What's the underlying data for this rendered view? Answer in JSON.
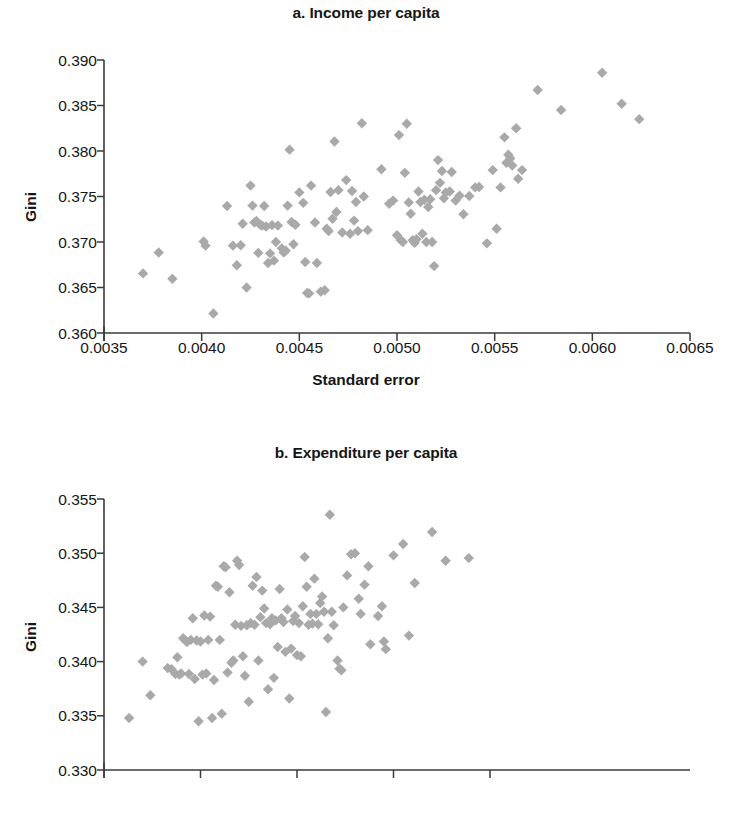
{
  "figure": {
    "marker_color": "#a9a9a9",
    "axis_color": "#3a3a3a",
    "text_color": "#161616",
    "background": "#ffffff"
  },
  "panel_a": {
    "title": "a. Income per capita",
    "ylabel": "Gini",
    "xlabel": "Standard error"
  },
  "panel_b": {
    "title": "b. Expenditure per capita",
    "ylabel": "Gini",
    "xlabel": "Standard error"
  },
  "chart_data": [
    {
      "type": "scatter",
      "id": "a",
      "title": "a. Income per capita",
      "xlabel": "Standard error",
      "ylabel": "Gini",
      "xlim": [
        0.0035,
        0.0065
      ],
      "ylim": [
        0.36,
        0.39
      ],
      "xticks": [
        0.0035,
        0.004,
        0.0045,
        0.005,
        0.0055,
        0.006,
        0.0065
      ],
      "xtick_labels": [
        "0.0035",
        "0.0040",
        "0.0045",
        "0.0050",
        "0.0055",
        "0.0060",
        "0.0065"
      ],
      "yticks": [
        0.36,
        0.365,
        0.37,
        0.375,
        0.38,
        0.385,
        0.39
      ],
      "ytick_labels": [
        "0.360",
        "0.365",
        "0.370",
        "0.375",
        "0.380",
        "0.385",
        "0.390"
      ],
      "grid": false,
      "legend": null,
      "marker": "diamond",
      "marker_color": "#a9a9a9",
      "points": [
        [
          0.0037,
          0.36655
        ],
        [
          0.00378,
          0.36885
        ],
        [
          0.00385,
          0.36595
        ],
        [
          0.00401,
          0.37005
        ],
        [
          0.00402,
          0.3696
        ],
        [
          0.00406,
          0.36215
        ],
        [
          0.00413,
          0.37395
        ],
        [
          0.00416,
          0.3696
        ],
        [
          0.00418,
          0.36745
        ],
        [
          0.0042,
          0.36965
        ],
        [
          0.00421,
          0.372
        ],
        [
          0.00423,
          0.365
        ],
        [
          0.00425,
          0.3762
        ],
        [
          0.00426,
          0.374
        ],
        [
          0.00427,
          0.37215
        ],
        [
          0.00428,
          0.3723
        ],
        [
          0.00429,
          0.3688
        ],
        [
          0.0043,
          0.3719
        ],
        [
          0.00431,
          0.3718
        ],
        [
          0.00432,
          0.37395
        ],
        [
          0.00433,
          0.3717
        ],
        [
          0.00434,
          0.3677
        ],
        [
          0.00435,
          0.36875
        ],
        [
          0.00436,
          0.37185
        ],
        [
          0.00437,
          0.36795
        ],
        [
          0.00438,
          0.37
        ],
        [
          0.00439,
          0.3718
        ],
        [
          0.00441,
          0.3693
        ],
        [
          0.00442,
          0.36885
        ],
        [
          0.00443,
          0.36905
        ],
        [
          0.00444,
          0.374
        ],
        [
          0.00445,
          0.38015
        ],
        [
          0.00446,
          0.3722
        ],
        [
          0.00447,
          0.36975
        ],
        [
          0.00448,
          0.3719
        ],
        [
          0.0045,
          0.37545
        ],
        [
          0.00452,
          0.3743
        ],
        [
          0.00453,
          0.3678
        ],
        [
          0.00454,
          0.3644
        ],
        [
          0.00455,
          0.36435
        ],
        [
          0.00456,
          0.3762
        ],
        [
          0.00458,
          0.37215
        ],
        [
          0.00459,
          0.3677
        ],
        [
          0.00461,
          0.36455
        ],
        [
          0.00463,
          0.3647
        ],
        [
          0.00464,
          0.37145
        ],
        [
          0.00465,
          0.3712
        ],
        [
          0.00466,
          0.3755
        ],
        [
          0.00467,
          0.37255
        ],
        [
          0.00468,
          0.38105
        ],
        [
          0.00469,
          0.3733
        ],
        [
          0.0047,
          0.3757
        ],
        [
          0.00472,
          0.37105
        ],
        [
          0.00474,
          0.3768
        ],
        [
          0.00476,
          0.3709
        ],
        [
          0.00477,
          0.3756
        ],
        [
          0.00478,
          0.37235
        ],
        [
          0.00479,
          0.3744
        ],
        [
          0.0048,
          0.3712
        ],
        [
          0.00482,
          0.38305
        ],
        [
          0.00483,
          0.375
        ],
        [
          0.00485,
          0.3713
        ],
        [
          0.00492,
          0.378
        ],
        [
          0.00496,
          0.3742
        ],
        [
          0.00498,
          0.37455
        ],
        [
          0.005,
          0.37075
        ],
        [
          0.00501,
          0.38175
        ],
        [
          0.00502,
          0.3702
        ],
        [
          0.00503,
          0.37
        ],
        [
          0.00504,
          0.3776
        ],
        [
          0.00505,
          0.383
        ],
        [
          0.00506,
          0.37435
        ],
        [
          0.00507,
          0.3731
        ],
        [
          0.00508,
          0.3702
        ],
        [
          0.00509,
          0.3699
        ],
        [
          0.0051,
          0.3703
        ],
        [
          0.00511,
          0.37555
        ],
        [
          0.00512,
          0.3744
        ],
        [
          0.00513,
          0.3709
        ],
        [
          0.00514,
          0.37465
        ],
        [
          0.00515,
          0.37
        ],
        [
          0.00516,
          0.37385
        ],
        [
          0.00517,
          0.3747
        ],
        [
          0.00518,
          0.37
        ],
        [
          0.00519,
          0.36735
        ],
        [
          0.0052,
          0.3757
        ],
        [
          0.00521,
          0.379
        ],
        [
          0.00522,
          0.3765
        ],
        [
          0.00523,
          0.3778
        ],
        [
          0.00524,
          0.3748
        ],
        [
          0.00525,
          0.37545
        ],
        [
          0.00527,
          0.37555
        ],
        [
          0.00528,
          0.3777
        ],
        [
          0.0053,
          0.37455
        ],
        [
          0.00532,
          0.3751
        ],
        [
          0.00534,
          0.37305
        ],
        [
          0.00537,
          0.37505
        ],
        [
          0.0054,
          0.376
        ],
        [
          0.00542,
          0.37605
        ],
        [
          0.00546,
          0.36985
        ],
        [
          0.00549,
          0.3779
        ],
        [
          0.00551,
          0.37145
        ],
        [
          0.00553,
          0.376
        ],
        [
          0.00555,
          0.3815
        ],
        [
          0.00556,
          0.3787
        ],
        [
          0.00557,
          0.3796
        ],
        [
          0.00558,
          0.3792
        ],
        [
          0.00559,
          0.3784
        ],
        [
          0.00561,
          0.3825
        ],
        [
          0.00562,
          0.37695
        ],
        [
          0.00564,
          0.3779
        ],
        [
          0.00572,
          0.3867
        ],
        [
          0.00584,
          0.3845
        ],
        [
          0.00605,
          0.3886
        ],
        [
          0.00615,
          0.3852
        ],
        [
          0.00624,
          0.3835
        ]
      ]
    },
    {
      "type": "scatter",
      "id": "b",
      "title": "b. Expenditure per capita",
      "xlabel": "Standard error",
      "ylabel": "Gini",
      "xlim": [
        0.0032,
        0.00546
      ],
      "ylim": [
        0.33,
        0.355
      ],
      "xticks": [
        0.0032,
        0.0037,
        0.0042,
        0.0047,
        0.0052
      ],
      "xtick_labels": [
        "0.0032",
        "0.0037",
        "0.0042",
        "0.0047",
        "0.0052"
      ],
      "yticks": [
        0.33,
        0.335,
        0.34,
        0.345,
        0.35,
        0.355
      ],
      "ytick_labels": [
        "0.330",
        "0.335",
        "0.340",
        "0.345",
        "0.350",
        "0.355"
      ],
      "grid": false,
      "legend": null,
      "marker": "diamond",
      "marker_color": "#a9a9a9",
      "points": [
        [
          0.00333,
          0.3348
        ],
        [
          0.0034,
          0.34
        ],
        [
          0.00344,
          0.3369
        ],
        [
          0.00353,
          0.3394
        ],
        [
          0.00355,
          0.3393
        ],
        [
          0.00357,
          0.33885
        ],
        [
          0.00358,
          0.3404
        ],
        [
          0.00359,
          0.3388
        ],
        [
          0.0036,
          0.3389
        ],
        [
          0.00361,
          0.34215
        ],
        [
          0.00362,
          0.342
        ],
        [
          0.00363,
          0.3418
        ],
        [
          0.00364,
          0.33885
        ],
        [
          0.00365,
          0.342
        ],
        [
          0.00366,
          0.344
        ],
        [
          0.00367,
          0.3384
        ],
        [
          0.00368,
          0.34195
        ],
        [
          0.00369,
          0.3345
        ],
        [
          0.0037,
          0.34185
        ],
        [
          0.00371,
          0.3388
        ],
        [
          0.00372,
          0.34425
        ],
        [
          0.00373,
          0.3389
        ],
        [
          0.00374,
          0.342
        ],
        [
          0.00375,
          0.34415
        ],
        [
          0.00376,
          0.3348
        ],
        [
          0.00377,
          0.3383
        ],
        [
          0.00378,
          0.347
        ],
        [
          0.00379,
          0.3469
        ],
        [
          0.0038,
          0.342
        ],
        [
          0.00381,
          0.3352
        ],
        [
          0.00382,
          0.3488
        ],
        [
          0.00383,
          0.3487
        ],
        [
          0.00384,
          0.339
        ],
        [
          0.00385,
          0.3464
        ],
        [
          0.00386,
          0.3399
        ],
        [
          0.00387,
          0.3401
        ],
        [
          0.00388,
          0.3434
        ],
        [
          0.00389,
          0.3493
        ],
        [
          0.0039,
          0.3489
        ],
        [
          0.00391,
          0.3433
        ],
        [
          0.00392,
          0.3405
        ],
        [
          0.00393,
          0.3387
        ],
        [
          0.00394,
          0.34335
        ],
        [
          0.00395,
          0.3363
        ],
        [
          0.00396,
          0.34355
        ],
        [
          0.00397,
          0.347
        ],
        [
          0.00398,
          0.3434
        ],
        [
          0.00399,
          0.3478
        ],
        [
          0.004,
          0.3401
        ],
        [
          0.00401,
          0.3441
        ],
        [
          0.00402,
          0.34655
        ],
        [
          0.00403,
          0.3449
        ],
        [
          0.00404,
          0.34355
        ],
        [
          0.00405,
          0.33745
        ],
        [
          0.00406,
          0.34345
        ],
        [
          0.00407,
          0.344
        ],
        [
          0.00408,
          0.3385
        ],
        [
          0.00409,
          0.3438
        ],
        [
          0.0041,
          0.34135
        ],
        [
          0.00411,
          0.3467
        ],
        [
          0.00412,
          0.344
        ],
        [
          0.00413,
          0.34365
        ],
        [
          0.00414,
          0.3409
        ],
        [
          0.00415,
          0.3448
        ],
        [
          0.00416,
          0.3366
        ],
        [
          0.00417,
          0.3412
        ],
        [
          0.00418,
          0.34375
        ],
        [
          0.00419,
          0.3442
        ],
        [
          0.0042,
          0.3406
        ],
        [
          0.00421,
          0.34355
        ],
        [
          0.00422,
          0.3405
        ],
        [
          0.00423,
          0.3451
        ],
        [
          0.00424,
          0.34965
        ],
        [
          0.00425,
          0.3469
        ],
        [
          0.00426,
          0.3434
        ],
        [
          0.00427,
          0.3444
        ],
        [
          0.00428,
          0.3435
        ],
        [
          0.00429,
          0.34765
        ],
        [
          0.0043,
          0.3444
        ],
        [
          0.00431,
          0.34345
        ],
        [
          0.00432,
          0.3454
        ],
        [
          0.00433,
          0.346
        ],
        [
          0.00434,
          0.3446
        ],
        [
          0.00435,
          0.33535
        ],
        [
          0.00436,
          0.34215
        ],
        [
          0.00437,
          0.35355
        ],
        [
          0.00438,
          0.3446
        ],
        [
          0.00439,
          0.34335
        ],
        [
          0.00441,
          0.3401
        ],
        [
          0.00442,
          0.33935
        ],
        [
          0.00443,
          0.3392
        ],
        [
          0.00444,
          0.345
        ],
        [
          0.00446,
          0.34795
        ],
        [
          0.00448,
          0.3499
        ],
        [
          0.0045,
          0.35
        ],
        [
          0.00452,
          0.3458
        ],
        [
          0.00453,
          0.3444
        ],
        [
          0.00455,
          0.3471
        ],
        [
          0.00457,
          0.3488
        ],
        [
          0.00458,
          0.3416
        ],
        [
          0.00462,
          0.3442
        ],
        [
          0.00464,
          0.3451
        ],
        [
          0.00465,
          0.34185
        ],
        [
          0.00466,
          0.34115
        ],
        [
          0.0047,
          0.3498
        ],
        [
          0.00475,
          0.35085
        ],
        [
          0.00478,
          0.3424
        ],
        [
          0.00481,
          0.34725
        ],
        [
          0.0049,
          0.35195
        ],
        [
          0.00497,
          0.3493
        ],
        [
          0.00509,
          0.34955
        ]
      ]
    }
  ]
}
